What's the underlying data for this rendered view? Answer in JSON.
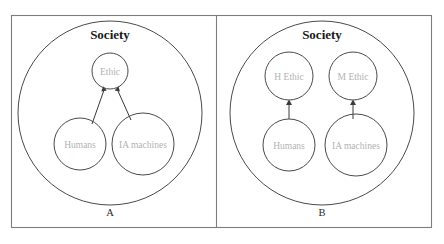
{
  "figure": {
    "title_left": "Society",
    "title_right": "Society",
    "panel_a_label": "A",
    "panel_b_label": "B",
    "colors": {
      "background": "#ffffff",
      "frame_stroke": "#7d7d80",
      "circle_stroke": "#4a4a4a",
      "connector_stroke": "#3a3a3a",
      "title_text": "#1a1a1a",
      "node_text": "#b2b2b4",
      "panel_text": "#2a2a2a"
    }
  },
  "panel_a": {
    "label": "A",
    "container_label": "Society",
    "nodes": [
      {
        "id": "ethic",
        "label": "Ethic",
        "cx": 110,
        "cy": 71,
        "r": 18
      },
      {
        "id": "humans",
        "label": "Humans",
        "cx": 80,
        "cy": 144,
        "r": 26
      },
      {
        "id": "ia-machines",
        "label": "IA machines",
        "cx": 143,
        "cy": 144,
        "r": 31
      }
    ],
    "edges": [
      {
        "from": "humans",
        "to": "ethic",
        "arrow": true
      },
      {
        "from": "ia-machines",
        "to": "ethic",
        "arrow": true
      }
    ]
  },
  "panel_b": {
    "label": "B",
    "container_label": "Society",
    "nodes": [
      {
        "id": "h-ethic",
        "label": "H Ethic",
        "cx": 289,
        "cy": 76,
        "r": 24
      },
      {
        "id": "m-ethic",
        "label": "M Ethic",
        "cx": 353,
        "cy": 76,
        "r": 24
      },
      {
        "id": "humans",
        "label": "Humans",
        "cx": 289,
        "cy": 145,
        "r": 26
      },
      {
        "id": "ia-machines",
        "label": "IA machines",
        "cx": 356,
        "cy": 145,
        "r": 31
      }
    ],
    "edges": [
      {
        "from": "humans",
        "to": "h-ethic",
        "arrow": true
      },
      {
        "from": "ia-machines",
        "to": "m-ethic",
        "arrow": true
      }
    ]
  }
}
